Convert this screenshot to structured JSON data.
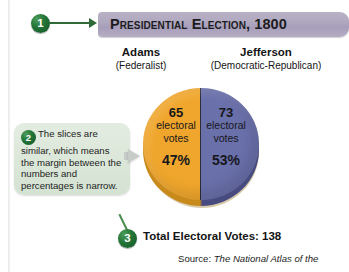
{
  "banner": {
    "title": "Presidential Election, 1800",
    "bg_color": "#aea6bd"
  },
  "markers": {
    "one": "1",
    "two": "2",
    "three": "3",
    "color": "#1d6b31"
  },
  "candidates": [
    {
      "name": "Adams",
      "party": "(Federalist)"
    },
    {
      "name": "Jefferson",
      "party": "(Democratic-Republican)"
    }
  ],
  "callout": {
    "text": "The slices are similar, which means the margin between the numbers and percentages is narrow.",
    "bg_color": "#dbe7d9"
  },
  "total": {
    "label": "Total Electoral Votes: ",
    "value": "138"
  },
  "source": {
    "prefix": "Source: ",
    "title": "The National Atlas of the"
  },
  "chart_data": {
    "type": "pie",
    "title": "Presidential Election, 1800",
    "categories": [
      "Adams",
      "Jefferson"
    ],
    "values": [
      65,
      73
    ],
    "percentages": [
      47,
      53
    ],
    "total": 138,
    "unit": "electoral votes",
    "colors": [
      "#f0a62c",
      "#6a70aa"
    ],
    "legend": "outside-top",
    "slices": [
      {
        "name": "Adams",
        "party": "(Federalist)",
        "votes": "65",
        "votes_label": "electoral\nvotes",
        "votes_label_line1": "electoral",
        "votes_label_line2": "votes",
        "percent": "47%",
        "color": "#f0a62c"
      },
      {
        "name": "Jefferson",
        "party": "(Democratic-Republican)",
        "votes": "73",
        "votes_label_line1": "electoral",
        "votes_label_line2": "votes",
        "percent": "53%",
        "color": "#6a70aa"
      }
    ]
  }
}
